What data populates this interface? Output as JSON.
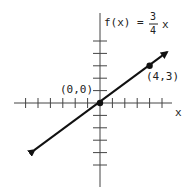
{
  "chart_data": {
    "type": "line",
    "function_label": {
      "lhs": "f(x) =",
      "num": "3",
      "den": "4",
      "var": "x"
    },
    "xlabel": "x",
    "ylabel": "f(x)",
    "xlim": [
      -7,
      6
    ],
    "ylim": [
      -7,
      7
    ],
    "x_ticks": [
      -6,
      -5,
      -4,
      -3,
      -2,
      -1,
      1,
      2,
      3,
      4,
      5
    ],
    "y_ticks": [
      -5,
      -4,
      -3,
      -2,
      -1,
      1,
      2,
      3,
      4,
      5
    ],
    "grid": false,
    "series": [
      {
        "name": "f(x) = 3/4 x",
        "slope": 0.75,
        "intercept": 0,
        "x": [
          -5.3,
          5.4
        ],
        "y": [
          -3.8,
          4.1
        ],
        "arrows": true
      }
    ],
    "points": [
      {
        "x": 0,
        "y": 0,
        "label": "(0,0)"
      },
      {
        "x": 4,
        "y": 3,
        "label": "(4,3)"
      }
    ]
  },
  "colors": {
    "axis": "#444444",
    "line": "#111111",
    "text": "#222222"
  }
}
